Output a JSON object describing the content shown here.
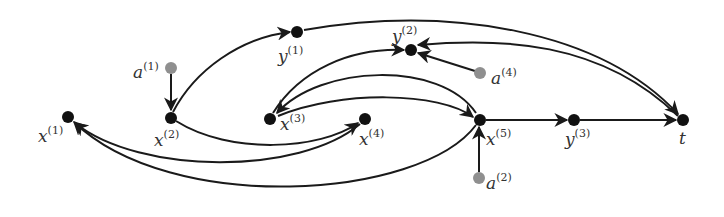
{
  "diagram": {
    "type": "directed-graph",
    "colors": {
      "node_primary": "#111111",
      "node_auxiliary": "#8f8f8f",
      "edge": "#1a1a1a",
      "label": "#333333"
    },
    "nodes": [
      {
        "id": "x1",
        "base": "x",
        "sup": "(1)",
        "kind": "primary"
      },
      {
        "id": "x2",
        "base": "x",
        "sup": "(2)",
        "kind": "primary"
      },
      {
        "id": "x3",
        "base": "x",
        "sup": "(3)",
        "kind": "primary"
      },
      {
        "id": "x4",
        "base": "x",
        "sup": "(4)",
        "kind": "primary"
      },
      {
        "id": "x5",
        "base": "x",
        "sup": "(5)",
        "kind": "primary"
      },
      {
        "id": "y1",
        "base": "y",
        "sup": "(1)",
        "kind": "primary"
      },
      {
        "id": "y2",
        "base": "y",
        "sup": "(2)",
        "kind": "primary"
      },
      {
        "id": "y3",
        "base": "y",
        "sup": "(3)",
        "kind": "primary"
      },
      {
        "id": "t",
        "base": "t",
        "sup": "",
        "kind": "primary"
      },
      {
        "id": "a1",
        "base": "a",
        "sup": "(1)",
        "kind": "auxiliary"
      },
      {
        "id": "a2",
        "base": "a",
        "sup": "(2)",
        "kind": "auxiliary"
      },
      {
        "id": "a4",
        "base": "a",
        "sup": "(4)",
        "kind": "auxiliary"
      }
    ],
    "edges": [
      {
        "from": "a1",
        "to": "x2"
      },
      {
        "from": "x2",
        "to": "y1"
      },
      {
        "from": "y1",
        "to": "t"
      },
      {
        "from": "x2",
        "to": "x4"
      },
      {
        "from": "x4",
        "to": "x1"
      },
      {
        "from": "x5",
        "to": "x1"
      },
      {
        "from": "x3",
        "to": "y2"
      },
      {
        "from": "x5",
        "to": "x3"
      },
      {
        "from": "x3",
        "to": "x5"
      },
      {
        "from": "a4",
        "to": "y2"
      },
      {
        "from": "t",
        "to": "y2"
      },
      {
        "from": "x5",
        "to": "y3"
      },
      {
        "from": "y3",
        "to": "t"
      },
      {
        "from": "a2",
        "to": "x5"
      }
    ]
  }
}
